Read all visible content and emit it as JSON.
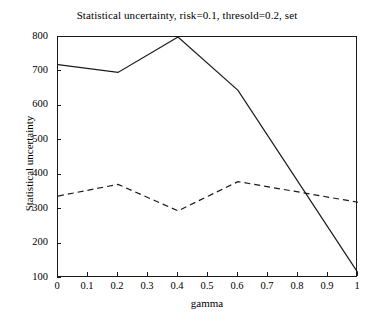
{
  "chart_data": {
    "type": "line",
    "title": "Statistical uncertainty, risk=0.1, thresold=0.2, set",
    "xlabel": "gamma",
    "ylabel": "Statistical uncertainty",
    "xlim": [
      0,
      1
    ],
    "ylim": [
      100,
      800
    ],
    "grid": false,
    "legend": null,
    "xticks": [
      "0",
      "0.1",
      "0.2",
      "0.3",
      "0.4",
      "0.5",
      "0.6",
      "0.7",
      "0.8",
      "0.9",
      "1"
    ],
    "xtick_values": [
      0,
      0.1,
      0.2,
      0.3,
      0.4,
      0.5,
      0.6,
      0.7,
      0.8,
      0.9,
      1
    ],
    "yticks": [
      "100",
      "200",
      "300",
      "400",
      "500",
      "600",
      "700",
      "800"
    ],
    "ytick_values": [
      100,
      200,
      300,
      400,
      500,
      600,
      700,
      800
    ],
    "x": [
      0,
      0.2,
      0.4,
      0.6,
      1
    ],
    "series": [
      {
        "name": "solid",
        "style": "solid",
        "color": "#1a1a1a",
        "x": [
          0,
          0.2,
          0.4,
          0.6,
          1
        ],
        "values": [
          720,
          697,
          800,
          645,
          115
        ]
      },
      {
        "name": "dashed",
        "style": "dashed",
        "color": "#1a1a1a",
        "x": [
          0,
          0.2,
          0.4,
          0.6,
          1
        ],
        "values": [
          338,
          372,
          295,
          380,
          320
        ]
      }
    ]
  },
  "axes": {
    "title": "Statistical uncertainty, risk=0.1, thresold=0.2, set",
    "xlabel": "gamma",
    "ylabel": "Statistical uncertainty"
  }
}
